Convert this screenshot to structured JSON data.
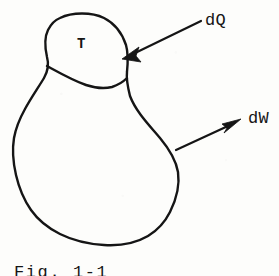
{
  "figure": {
    "kind": "hand-drawn-thermodynamics-diagram",
    "background_color": "#fdfdfb",
    "ink_color": "#151515",
    "system_label": "T",
    "heat_label": "dQ",
    "work_label": "dW",
    "caption": "Fig. 1-1",
    "caption_clipped": true
  },
  "labels": {
    "temperature": "T",
    "heat_transfer": "dQ",
    "work_transfer": "dW"
  },
  "arrows": {
    "heat": {
      "name": "dQ",
      "direction": "inward",
      "tail_x": 200,
      "tail_y": 22,
      "tip_x": 124,
      "tip_y": 58
    },
    "work": {
      "name": "dW",
      "direction": "outward",
      "tail_x": 176,
      "tail_y": 150,
      "tip_x": 240,
      "tip_y": 120
    }
  },
  "geometry": {
    "upper_lobe_note": "dome-shaped sub-region containing T",
    "lower_body_note": "large irregular closed blob",
    "divider_note": "curved internal boundary between upper lobe and lower body"
  }
}
